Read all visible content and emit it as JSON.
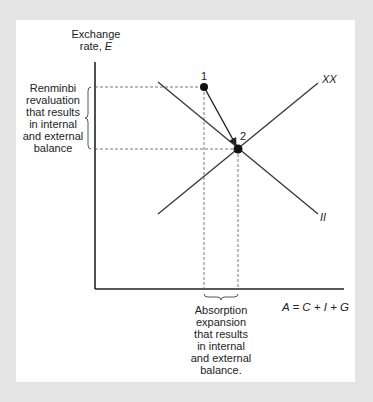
{
  "diagram": {
    "y_axis_label": {
      "line1": "Exchange",
      "line2_prefix": "rate, ",
      "line2_var": "E"
    },
    "x_axis_label": "A = C + I + G",
    "curves": [
      {
        "name": "XX",
        "label": "XX",
        "from": [
          158,
          214
        ],
        "to": [
          318,
          83
        ]
      },
      {
        "name": "II",
        "label": "II",
        "from": [
          158,
          82
        ],
        "to": [
          318,
          214
        ]
      }
    ],
    "points": [
      {
        "id": "1",
        "label": "1",
        "x": 204,
        "y": 87
      },
      {
        "id": "2",
        "label": "2",
        "x": 238,
        "y": 149
      }
    ],
    "arrow": {
      "from": "1",
      "to": "2"
    },
    "left_annotation": "Renminbi\nrevaluation\nthat results\nin internal\nand external\nbalance",
    "bottom_annotation": "Absorption\nexpansion\nthat results\nin internal\nand external\nbalance.",
    "colors": {
      "background": "#e4e4e4",
      "panel": "#ffffff",
      "axis": "#222222",
      "curve": "#3a3a3a",
      "dashed": "#555555",
      "point": "#111111"
    }
  }
}
